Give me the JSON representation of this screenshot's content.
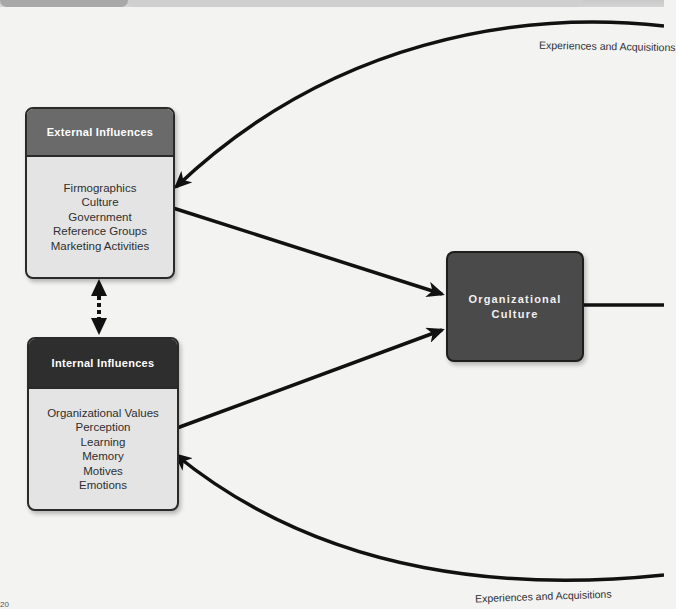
{
  "diagram": {
    "external_influences": {
      "title": "External Influences",
      "items": [
        "Firmographics",
        "Culture",
        "Government",
        "Reference Groups",
        "Marketing Activities"
      ]
    },
    "internal_influences": {
      "title": "Internal Influences",
      "items": [
        "Organizational Values",
        "Perception",
        "Learning",
        "Memory",
        "Motives",
        "Emotions"
      ]
    },
    "organizational_culture": {
      "title": "Organizational Culture"
    },
    "feedback_labels": {
      "top": "Experiences and Acquisitions",
      "bottom": "Experiences and Acquisitions"
    },
    "page_number": "20"
  },
  "colors": {
    "background": "#f3f3f2",
    "external_header": "#6a6a6a",
    "internal_header": "#2e2e2e",
    "box_body": "#e4e4e4",
    "org_box": "#4a4a4a",
    "arrow": "#111111"
  }
}
